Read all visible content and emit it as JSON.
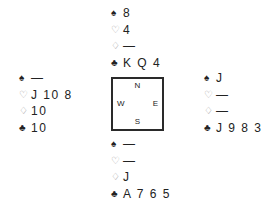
{
  "suits": {
    "spade": "♠",
    "heart": "♡",
    "diamond": "♢",
    "club": "♣"
  },
  "hands": {
    "north": {
      "spades": "8",
      "hearts": "4",
      "diamonds": "—",
      "clubs": "K Q 4"
    },
    "west": {
      "spades": "—",
      "hearts": "J 10 8",
      "diamonds": "10",
      "clubs": "10"
    },
    "east": {
      "spades": "J",
      "hearts": "—",
      "diamonds": "—",
      "clubs": "J 9 8 3"
    },
    "south": {
      "spades": "—",
      "hearts": "—",
      "diamonds": "J",
      "clubs": "A 7 6 5"
    }
  },
  "compass": {
    "north": "N",
    "south": "S",
    "west": "W",
    "east": "E"
  },
  "colors": {
    "text": "#222222",
    "outline_suit": "#9a9a9a",
    "box_border": "#2a2a2a",
    "background": "#ffffff"
  }
}
